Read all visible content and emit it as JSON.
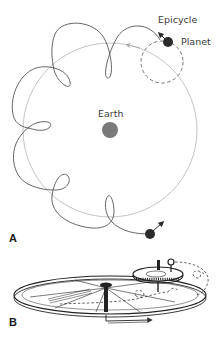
{
  "figure": {
    "panel_a": {
      "label": "A",
      "labels": {
        "epicycle": "Epicycle",
        "planet": "Planet",
        "earth": "Earth"
      },
      "elements": {
        "deferent_circle": "large gray circle around Earth",
        "epicycle_circle": "dashed small circle carrying the planet",
        "retrograde_path": "looping path traced by planet",
        "direction_arrows": [
          "arrow near planet on epicycle",
          "arrow on deferent",
          "arrow at end of path"
        ]
      }
    },
    "panel_b": {
      "label": "B",
      "description": "mechanical model: large wheel (deferent) with small gear (epicycle) carrying planet, dashed looping path"
    },
    "colors": {
      "deferent": "#b8b8b8",
      "path": "#555555",
      "planet": "#2b2b2b",
      "earth": "#7a7a7a",
      "text": "#3a3a3a"
    }
  }
}
